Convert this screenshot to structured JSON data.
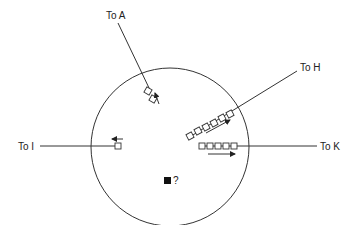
{
  "diagram": {
    "circle": {
      "cx": 170,
      "cy": 147,
      "r": 79
    },
    "connections": [
      {
        "id": "A",
        "label": "To A",
        "direction": "outgoing-up",
        "squares": 2
      },
      {
        "id": "H",
        "label": "To H",
        "direction": "outgoing",
        "squares": 6
      },
      {
        "id": "I",
        "label": "To I",
        "direction": "outgoing-left",
        "squares": 1
      },
      {
        "id": "K",
        "label": "To K",
        "direction": "outgoing-right",
        "squares": 5
      }
    ],
    "unknown_marker": {
      "symbol": "?"
    }
  },
  "labels": {
    "to_a": "To A",
    "to_h": "To H",
    "to_i": "To I",
    "to_k": "To K",
    "question": "?"
  }
}
